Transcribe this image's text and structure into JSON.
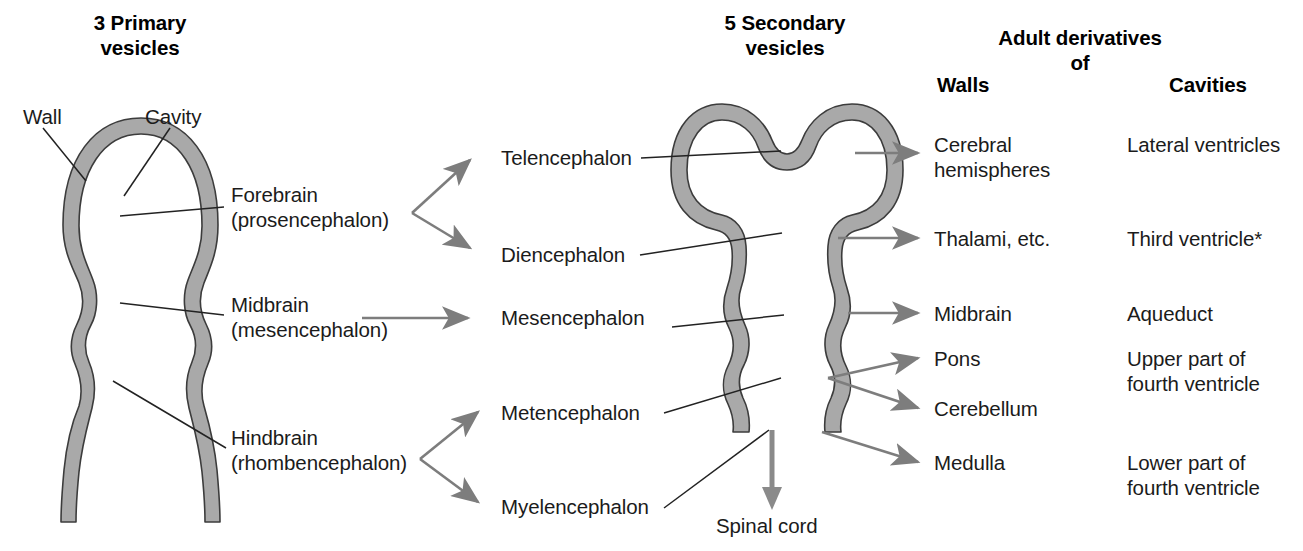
{
  "headers": {
    "primary": "3 Primary\nvesicles",
    "secondary": "5 Secondary\nvesicles",
    "adult": "Adult derivatives\nof",
    "walls": "Walls",
    "cavities": "Cavities"
  },
  "callouts": {
    "wall": "Wall",
    "cavity": "Cavity",
    "spinal_cord": "Spinal cord"
  },
  "primary_vesicles": [
    {
      "label": "Forebrain\n(prosencephalon)"
    },
    {
      "label": "Midbrain\n(mesencephalon)"
    },
    {
      "label": "Hindbrain\n(rhombencephalon)"
    }
  ],
  "secondary_vesicles": [
    {
      "label": "Telencephalon"
    },
    {
      "label": "Diencephalon"
    },
    {
      "label": "Mesencephalon"
    },
    {
      "label": "Metencephalon"
    },
    {
      "label": "Myelencephalon"
    }
  ],
  "derivatives": [
    {
      "wall": "Cerebral\nhemispheres",
      "cavity": "Lateral ventricles"
    },
    {
      "wall": "Thalami, etc.",
      "cavity": "Third ventricle*"
    },
    {
      "wall": "Midbrain",
      "cavity": "Aqueduct"
    },
    {
      "wall": "Pons",
      "cavity": "Upper part of\nfourth ventricle"
    },
    {
      "wall": "Cerebellum",
      "cavity": ""
    },
    {
      "wall": "Medulla",
      "cavity": "Lower part of\nfourth ventricle"
    }
  ],
  "colors": {
    "wall_fill": "#a9a9a9",
    "wall_stroke": "#3c3c3c",
    "arrow_gray": "#808080",
    "leader_line": "#222222",
    "text": "#1b1b1b",
    "background": "#ffffff"
  }
}
